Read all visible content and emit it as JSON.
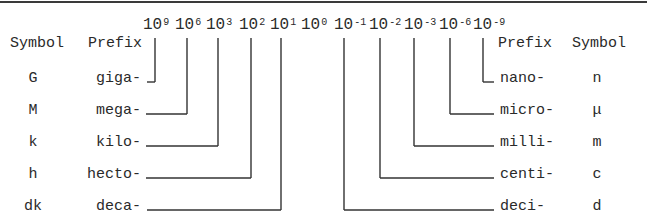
{
  "diagram": {
    "type": "SI prefix chart",
    "powers": [
      {
        "base": "10",
        "exp": "9"
      },
      {
        "base": "10",
        "exp": "6"
      },
      {
        "base": "10",
        "exp": "3"
      },
      {
        "base": "10",
        "exp": "2"
      },
      {
        "base": "10",
        "exp": "1"
      },
      {
        "base": "10",
        "exp": "0"
      },
      {
        "base": "10",
        "exp": "-1"
      },
      {
        "base": "10",
        "exp": "-2"
      },
      {
        "base": "10",
        "exp": "-3"
      },
      {
        "base": "10",
        "exp": "-6"
      },
      {
        "base": "10",
        "exp": "-9"
      }
    ],
    "left_headers": {
      "symbol": "Symbol",
      "prefix": "Prefix"
    },
    "right_headers": {
      "prefix": "Prefix",
      "symbol": "Symbol"
    },
    "left_rows": [
      {
        "symbol": "G",
        "prefix": "giga-",
        "power": "10^9"
      },
      {
        "symbol": "M",
        "prefix": "mega-",
        "power": "10^6"
      },
      {
        "symbol": "k",
        "prefix": "kilo-",
        "power": "10^3"
      },
      {
        "symbol": "h",
        "prefix": "hecto-",
        "power": "10^2"
      },
      {
        "symbol": "dk",
        "prefix": "deca-",
        "power": "10^1"
      }
    ],
    "right_rows": [
      {
        "prefix": "nano-",
        "symbol": "n",
        "power": "10^-9"
      },
      {
        "prefix": "micro-",
        "symbol": "μ",
        "power": "10^-6"
      },
      {
        "prefix": "milli-",
        "symbol": "m",
        "power": "10^-3"
      },
      {
        "prefix": "centi-",
        "symbol": "c",
        "power": "10^-2"
      },
      {
        "prefix": "deci-",
        "symbol": "d",
        "power": "10^-1"
      }
    ]
  }
}
